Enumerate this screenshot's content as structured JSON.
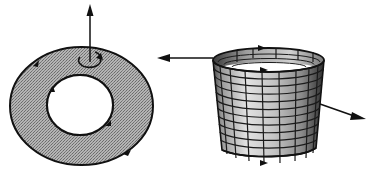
{
  "diagram": {
    "type": "orientation-of-surfaces",
    "figures": [
      {
        "id": "annulus",
        "description": "flat annulus (ring) with upward normal vector and orientation arrows on inner and outer boundary",
        "fill_color": "#a8a8a8",
        "stroke_color": "#111111",
        "normal_arrow": "up",
        "boundary_arrows": 4
      },
      {
        "id": "cylinder",
        "description": "open cylindrical surface with mesh grid, outward normal vectors and boundary orientation arrows",
        "fill_color": "#c8c8c8",
        "stroke_color": "#111111",
        "normal_arrows": [
          "left",
          "right-down"
        ],
        "boundary_arrows": 3
      }
    ],
    "colors": {
      "background": "#ffffff",
      "ink": "#111111",
      "shade_dark": "#555555",
      "shade_mid": "#a8a8a8",
      "shade_light": "#d6d6d6"
    }
  }
}
